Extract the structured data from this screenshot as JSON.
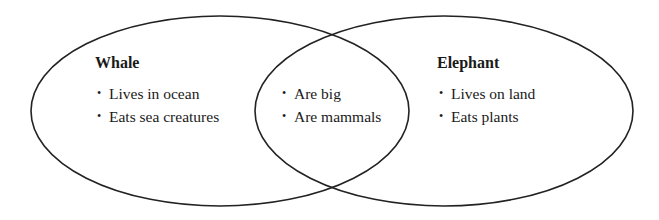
{
  "diagram": {
    "type": "venn",
    "sets": [
      {
        "title": "Whale",
        "items": [
          "Lives in ocean",
          "Eats sea creatures"
        ]
      },
      {
        "title": "Elephant",
        "items": [
          "Lives on land",
          "Eats plants"
        ]
      }
    ],
    "overlap": {
      "items": [
        "Are big",
        "Are mammals"
      ]
    },
    "bullet": "•",
    "stroke_color": "#222222"
  }
}
